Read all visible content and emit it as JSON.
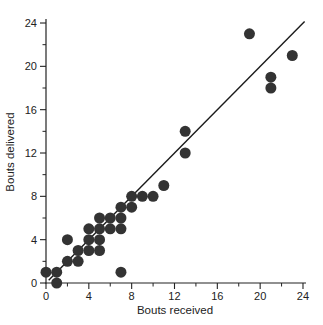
{
  "figure": {
    "title": "",
    "x_axis_title": "Bouts received",
    "y_axis_title": "Bouts delivered"
  },
  "chart_data": {
    "type": "scatter",
    "title": "",
    "xlabel": "Bouts received",
    "ylabel": "Bouts delivered",
    "xlim": [
      0,
      24
    ],
    "ylim": [
      0,
      24
    ],
    "x_major_ticks": [
      0,
      4,
      8,
      12,
      16,
      20,
      24
    ],
    "y_major_ticks": [
      0,
      4,
      8,
      12,
      16,
      20,
      24
    ],
    "x_minor_ticks": [
      2,
      6,
      10,
      14,
      18,
      22
    ],
    "y_minor_ticks": [
      2,
      6,
      10,
      14,
      18,
      22
    ],
    "grid": false,
    "legend": null,
    "point_color": "#333333",
    "axis_color": "#222222",
    "line_color": "#1a1a1a",
    "points": [
      [
        1,
        0
      ],
      [
        0,
        1
      ],
      [
        1,
        1
      ],
      [
        2,
        2
      ],
      [
        3,
        2
      ],
      [
        3,
        3
      ],
      [
        4,
        3
      ],
      [
        5,
        3
      ],
      [
        2,
        4
      ],
      [
        4,
        4
      ],
      [
        5,
        4
      ],
      [
        7,
        1
      ],
      [
        4,
        5
      ],
      [
        5,
        5
      ],
      [
        6,
        5
      ],
      [
        7,
        5
      ],
      [
        5,
        6
      ],
      [
        6,
        6
      ],
      [
        7,
        6
      ],
      [
        7,
        7
      ],
      [
        8,
        7
      ],
      [
        8,
        8
      ],
      [
        9,
        8
      ],
      [
        10,
        8
      ],
      [
        11,
        9
      ],
      [
        13,
        12
      ],
      [
        13,
        14
      ],
      [
        19,
        23
      ],
      [
        21,
        18
      ],
      [
        21,
        19
      ],
      [
        23,
        21
      ]
    ],
    "line": {
      "type": "equality",
      "from": [
        0.25,
        0.25
      ],
      "to": [
        24.15,
        24.15
      ]
    }
  }
}
